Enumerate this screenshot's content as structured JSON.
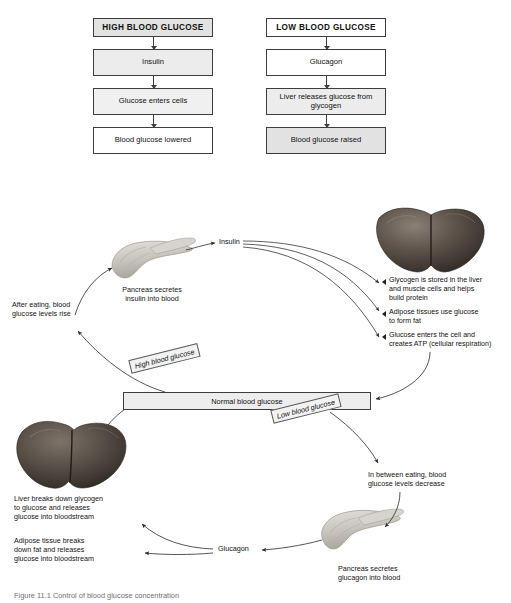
{
  "flowchart": {
    "left_column": [
      {
        "label": "HIGH BLOOD GLUCOSE",
        "style": "title",
        "fill": "#e2e2e2"
      },
      {
        "label": "Insulin",
        "style": "body",
        "fill": "#e6e6e6"
      },
      {
        "label": "Glucose enters cells",
        "style": "body",
        "fill": "#f0f0f0"
      },
      {
        "label": "Blood glucose lowered",
        "style": "body",
        "fill": "#ffffff"
      }
    ],
    "right_column": [
      {
        "label": "LOW BLOOD GLUCOSE",
        "style": "title",
        "fill": "#ffffff"
      },
      {
        "label": "Glucagon",
        "style": "body",
        "fill": "#ffffff"
      },
      {
        "label": "Liver releases\nglucose from glycogen",
        "style": "body",
        "fill": "#ececec"
      },
      {
        "label": "Blood glucose raised",
        "style": "body",
        "fill": "#e2e2e2"
      }
    ]
  },
  "cycle": {
    "pancreas_top_caption": "Pancreas secretes\ninsulin into blood",
    "after_eating_label": "After eating, blood\nglucose levels rise",
    "insulin_label": "Insulin",
    "glucagon_label": "Glucagon",
    "normal_box_label": "Normal blood glucose",
    "high_blood_glucose_label": "High blood glucose",
    "low_blood_glucose_label": "Low blood glucose",
    "in_between_eating_label": "In between eating, blood\nglucose levels decrease",
    "pancreas_bottom_caption": "Pancreas secretes\nglucagon into blood",
    "liver_breakdown_label": "Liver breaks down glycogen\nto glucose and releases\nglucose into bloodstream",
    "adipose_label": "Adipose tissue breaks\ndown fat and releases\nglucose into bloodstream",
    "insulin_effects": [
      "Glycogen is stored in the liver\nand muscle cells and helps\nbuild protein",
      "Adipose tissues use glucose\nto form fat",
      "Glucose enters the cell and\ncreates ATP (cellular respiration)"
    ]
  },
  "caption": "Figure 11.1 Control of blood glucose concentration",
  "colors": {
    "line": "#3d3d3d",
    "box_fill_dark": "#e2e2e2",
    "box_fill_light": "#f0f0f0",
    "liver": "#5a5048",
    "pancreas": "#c9c6bf",
    "caption_text": "#6f6f6f"
  }
}
